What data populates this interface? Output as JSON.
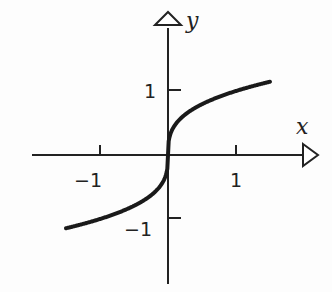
{
  "chart_data": {
    "type": "line",
    "title": "",
    "function": "y = x^(1/3)",
    "xlabel": "x",
    "ylabel": "y",
    "xlim": [
      -1.55,
      1.55
    ],
    "ylim": [
      -1.45,
      1.6
    ],
    "xticks": [
      -1,
      1
    ],
    "yticks": [
      -1,
      1
    ],
    "xtick_labels": [
      "−1",
      "1"
    ],
    "ytick_labels": [
      "−1",
      "1"
    ],
    "series": [
      {
        "name": "cube root",
        "color": "#222222",
        "x": [
          -1.5,
          -1,
          -0.5,
          -0.125,
          0,
          0.125,
          0.5,
          1,
          1.5
        ],
        "y": [
          -1.145,
          -1,
          -0.794,
          -0.5,
          0,
          0.5,
          0.794,
          1,
          1.145
        ]
      }
    ],
    "grid": false
  },
  "labels": {
    "x": "x",
    "y": "y",
    "xneg": "−1",
    "xpos": "1",
    "yneg": "−1",
    "ypos": "1"
  }
}
